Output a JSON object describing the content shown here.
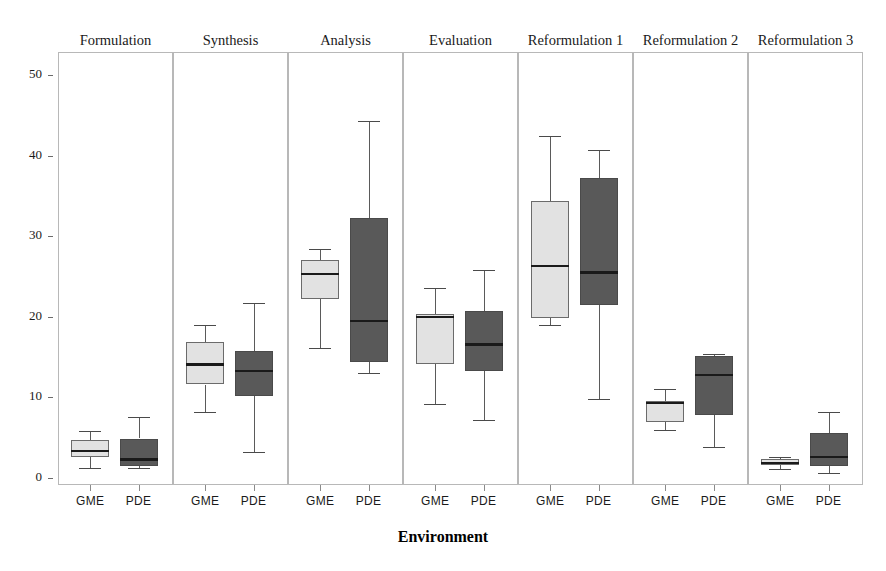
{
  "figure": {
    "top_cut_text": "",
    "axis_title_x": "Environment",
    "axis_title_y": "",
    "background": "#ffffff",
    "light_fill": "#e2e2e2",
    "dark_fill": "#595959",
    "box_stroke": "#6b6b6b",
    "median_color": "#1a1a1a",
    "panel_border": "#b8b8b8"
  },
  "chart_data": {
    "type": "box",
    "title": "",
    "xlabel": "Environment",
    "ylabel": "",
    "ylim": [
      0,
      52
    ],
    "yticks": [
      0,
      10,
      20,
      30,
      40,
      50
    ],
    "grid": false,
    "legend": "none",
    "panel_variable": "Phase",
    "group_variable": "Environment",
    "groups": [
      "GME",
      "PDE"
    ],
    "panels": [
      {
        "label": "Formulation",
        "boxes": [
          {
            "group": "GME",
            "fill": "light",
            "whisker_low": 1.3,
            "q1": 2.6,
            "median": 3.4,
            "q3": 4.7,
            "whisker_high": 5.8
          },
          {
            "group": "PDE",
            "fill": "dark",
            "whisker_low": 1.2,
            "q1": 1.5,
            "median": 2.3,
            "q3": 4.9,
            "whisker_high": 7.6
          }
        ]
      },
      {
        "label": "Synthesis",
        "boxes": [
          {
            "group": "GME",
            "fill": "light",
            "whisker_low": 8.2,
            "q1": 11.6,
            "median": 14.1,
            "q3": 16.9,
            "whisker_high": 19.0
          },
          {
            "group": "PDE",
            "fill": "dark",
            "whisker_low": 3.2,
            "q1": 10.2,
            "median": 13.3,
            "q3": 15.7,
            "whisker_high": 21.7
          }
        ]
      },
      {
        "label": "Analysis",
        "boxes": [
          {
            "group": "GME",
            "fill": "light",
            "whisker_low": 16.1,
            "q1": 22.2,
            "median": 25.3,
            "q3": 27.0,
            "whisker_high": 28.4
          },
          {
            "group": "PDE",
            "fill": "dark",
            "whisker_low": 13.0,
            "q1": 14.4,
            "median": 19.5,
            "q3": 32.2,
            "whisker_high": 44.3
          }
        ]
      },
      {
        "label": "Evaluation",
        "boxes": [
          {
            "group": "GME",
            "fill": "light",
            "whisker_low": 9.2,
            "q1": 14.1,
            "median": 20.0,
            "q3": 20.3,
            "whisker_high": 23.6
          },
          {
            "group": "PDE",
            "fill": "dark",
            "whisker_low": 7.2,
            "q1": 13.3,
            "median": 16.6,
            "q3": 20.7,
            "whisker_high": 25.8
          }
        ]
      },
      {
        "label": "Reformulation 1",
        "boxes": [
          {
            "group": "GME",
            "fill": "light",
            "whisker_low": 19.0,
            "q1": 19.8,
            "median": 26.3,
            "q3": 34.4,
            "whisker_high": 42.4
          },
          {
            "group": "PDE",
            "fill": "dark",
            "whisker_low": 9.8,
            "q1": 21.5,
            "median": 25.5,
            "q3": 37.2,
            "whisker_high": 40.7
          }
        ]
      },
      {
        "label": "Reformulation 2",
        "boxes": [
          {
            "group": "GME",
            "fill": "light",
            "whisker_low": 5.9,
            "q1": 6.9,
            "median": 9.3,
            "q3": 9.6,
            "whisker_high": 11.0
          },
          {
            "group": "PDE",
            "fill": "dark",
            "whisker_low": 3.9,
            "q1": 7.8,
            "median": 12.8,
            "q3": 15.1,
            "whisker_high": 15.4
          }
        ]
      },
      {
        "label": "Reformulation 3",
        "boxes": [
          {
            "group": "GME",
            "fill": "light",
            "whisker_low": 1.1,
            "q1": 1.6,
            "median": 1.9,
            "q3": 2.3,
            "whisker_high": 2.6
          },
          {
            "group": "PDE",
            "fill": "dark",
            "whisker_low": 0.6,
            "q1": 1.5,
            "median": 2.6,
            "q3": 5.6,
            "whisker_high": 8.2
          }
        ]
      }
    ]
  }
}
